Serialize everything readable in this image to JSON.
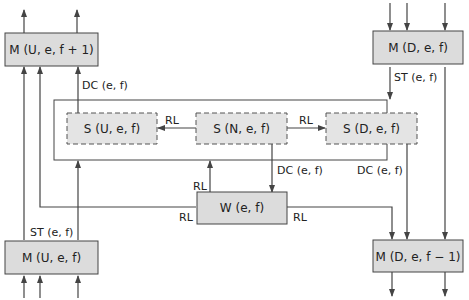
{
  "colors": {
    "line": "#444444",
    "box_fill": "#dcdcdc",
    "box_stroke": "#444444",
    "dashed_fill": "#e4e4e4"
  },
  "boxes": {
    "m_u_e_f1": "M (U, e, f + 1)",
    "m_d_e_f": "M (D, e, f)",
    "s_u_e_f": "S (U, e, f)",
    "s_n_e_f": "S (N, e, f)",
    "s_d_e_f": "S (D, e, f)",
    "w_e_f": "W (e, f)",
    "m_u_e_f": "M (U, e, f)",
    "m_d_e_f1": "M (D, e, f − 1)"
  },
  "labels": {
    "dc_top_left": "DC (e, f)",
    "st_top_right": "ST (e, f)",
    "rl_n_to_u": "RL",
    "rl_n_to_d": "RL",
    "rl_w_to_n": "RL",
    "dc_n_to_w": "DC (e, f)",
    "dc_d_down": "DC (e, f)",
    "rl_w_left": "RL",
    "rl_w_right": "RL",
    "st_bottom_left": "ST (e, f)"
  }
}
